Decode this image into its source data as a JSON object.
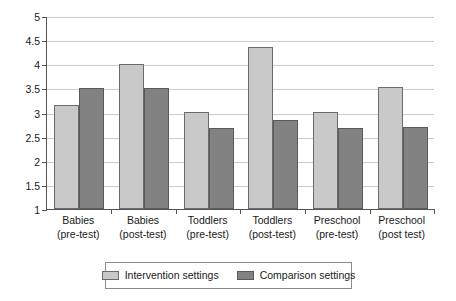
{
  "chart_data": {
    "type": "bar",
    "title": "",
    "subtitle": "",
    "xlabel": "",
    "ylabel": "",
    "ylim": [
      1,
      5
    ],
    "ytick_step": 0.5,
    "yticks": [
      "5",
      "4.5",
      "4",
      "3.5",
      "3",
      "2.5",
      "2",
      "1.5",
      "1"
    ],
    "ytick_values": [
      5,
      4.5,
      4,
      3.5,
      3,
      2.5,
      2,
      1.5,
      1
    ],
    "grid": true,
    "legend_position": "bottom",
    "categories": [
      "Babies (pre-test)",
      "Babies (post-test)",
      "Toddlers (pre-test)",
      "Toddlers (post-test)",
      "Preschool (pre-test)",
      "Preschool (post test)"
    ],
    "category_lines": [
      [
        "Babies",
        "(pre-test)"
      ],
      [
        "Babies",
        "(post-test)"
      ],
      [
        "Toddlers",
        "(pre-test)"
      ],
      [
        "Toddlers",
        "(post-test)"
      ],
      [
        "Preschool",
        "(pre-test)"
      ],
      [
        "Preschool",
        "(post test)"
      ]
    ],
    "series": [
      {
        "name": "Intervention settings",
        "color": "#c9c9c9",
        "values": [
          3.16,
          4.01,
          3.01,
          4.35,
          3.01,
          3.52
        ]
      },
      {
        "name": "Comparison settings",
        "color": "#828282",
        "values": [
          3.5,
          3.51,
          2.67,
          2.85,
          2.67,
          2.7
        ]
      }
    ]
  },
  "legend": {
    "items": [
      {
        "label": "Intervention settings",
        "swatch": "legend-swatch-intervention"
      },
      {
        "label": "Comparison settings",
        "swatch": "legend-swatch-comparison"
      }
    ]
  }
}
